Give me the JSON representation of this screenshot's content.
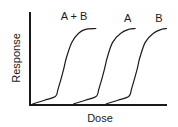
{
  "chart_data": {
    "type": "line",
    "title": "",
    "xlabel": "Dose",
    "ylabel": "Response",
    "xlim": [
      0,
      100
    ],
    "ylim": [
      0,
      100
    ],
    "grid": false,
    "legend": "none",
    "series": [
      {
        "name": "A + B",
        "label": "A + B",
        "x": [
          1,
          10,
          18,
          20,
          24,
          26,
          30,
          35,
          40,
          48
        ],
        "y": [
          0,
          5,
          10,
          20,
          45,
          60,
          80,
          92,
          97,
          98
        ]
      },
      {
        "name": "A",
        "label": "A",
        "x": [
          31,
          40,
          48,
          50,
          54,
          56,
          60,
          66,
          72,
          77
        ],
        "y": [
          0,
          5,
          10,
          20,
          45,
          60,
          80,
          92,
          97,
          98
        ]
      },
      {
        "name": "B",
        "label": "B",
        "x": [
          55,
          64,
          72,
          74,
          78,
          80,
          84,
          90,
          96,
          100
        ],
        "y": [
          0,
          5,
          10,
          20,
          45,
          60,
          80,
          92,
          97,
          98
        ]
      }
    ]
  },
  "colors": {
    "line": "#1a1a1a",
    "background": "#ffffff"
  }
}
